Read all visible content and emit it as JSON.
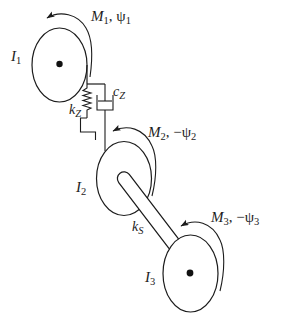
{
  "colors": {
    "background": "#ffffff",
    "line": "#1c1c1c",
    "text": "#1c1c1c"
  },
  "labels": {
    "i1": {
      "base": "I",
      "sub": "1"
    },
    "i2": {
      "base": "I",
      "sub": "2"
    },
    "i3": {
      "base": "I",
      "sub": "3"
    },
    "m1": {
      "moment": "M",
      "moment_sub": "1",
      "sep": ", ",
      "angle": "ψ",
      "angle_sub": "1"
    },
    "m2": {
      "moment": "M",
      "moment_sub": "2",
      "sep": ", −",
      "angle": "ψ",
      "angle_sub": "2"
    },
    "m3": {
      "moment": "M",
      "moment_sub": "3",
      "sep": ", −",
      "angle": "ψ",
      "angle_sub": "3"
    },
    "kz": {
      "base": "k",
      "sub": "Z"
    },
    "cz": {
      "base": "c",
      "sub": "Z"
    },
    "ks": {
      "base": "k",
      "sub": "S"
    }
  }
}
